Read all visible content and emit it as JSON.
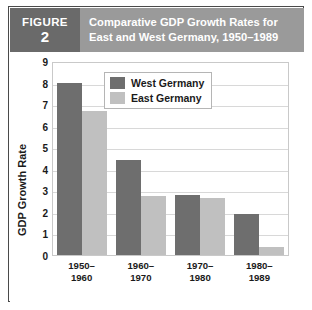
{
  "figure": {
    "badge_word": "FIGURE",
    "badge_number": "2",
    "title_line1": "Comparative GDP Growth Rates for",
    "title_line2": "East and West Germany, 1950–1989"
  },
  "colors": {
    "header_bar": "#9a9a9a",
    "badge": "#6a6a6a",
    "west": "#6e6e6e",
    "east": "#c0c0c0",
    "frame": "#4a4a4a",
    "grid": "#d8d8d8"
  },
  "chart_data": {
    "type": "bar",
    "title": "Comparative GDP Growth Rates for East and West Germany, 1950–1989",
    "xlabel": "",
    "ylabel": "GDP Growth Rate",
    "categories": [
      "1950–1960",
      "1960–1970",
      "1970–1980",
      "1980–1989"
    ],
    "category_lines": [
      [
        "1950–",
        "1960"
      ],
      [
        "1960–",
        "1970"
      ],
      [
        "1970–",
        "1980"
      ],
      [
        "1980–",
        "1989"
      ]
    ],
    "series": [
      {
        "name": "West Germany",
        "color": "#6e6e6e",
        "values": [
          8.0,
          4.4,
          2.8,
          1.9
        ]
      },
      {
        "name": "East Germany",
        "color": "#c0c0c0",
        "values": [
          6.7,
          2.75,
          2.65,
          0.35
        ]
      }
    ],
    "ylim": [
      0,
      9
    ],
    "yticks": [
      9,
      8,
      7,
      6,
      5,
      4,
      3,
      2,
      1,
      0
    ],
    "ytick_labels": [
      "9",
      "8",
      "7",
      "6",
      "5",
      "4",
      "3",
      "2",
      "1",
      "0"
    ],
    "grid": true,
    "legend_position": "top-center"
  }
}
